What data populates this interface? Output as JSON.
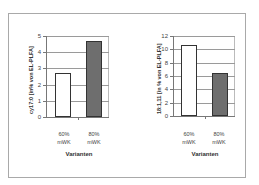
{
  "chart_data": [
    {
      "type": "bar",
      "title": "",
      "xlabel": "Varianten",
      "ylabel": "cy17:0 [in% von EL-PLFA]",
      "categories": [
        "60% mWK",
        "80% mWK"
      ],
      "category_lines": [
        [
          "60%",
          "mWK"
        ],
        [
          "80%",
          "mWK"
        ]
      ],
      "values": [
        2.7,
        4.7
      ],
      "bar_colors": [
        "#ffffff",
        "#6e6e6e"
      ],
      "ylim": [
        0,
        5
      ],
      "yticks": [
        "0",
        "1",
        "2",
        "3",
        "4",
        "5"
      ],
      "grid": true,
      "legend": null
    },
    {
      "type": "bar",
      "title": "",
      "xlabel": "Varianten",
      "ylabel": "18:1,11 [in % von EL-PLFA]",
      "categories": [
        "60% mWK",
        "80% mWK"
      ],
      "category_lines": [
        [
          "60%",
          "mWK"
        ],
        [
          "80%",
          "mWK"
        ]
      ],
      "values": [
        10.6,
        6.4
      ],
      "bar_colors": [
        "#ffffff",
        "#6e6e6e"
      ],
      "ylim": [
        0,
        12
      ],
      "yticks": [
        "0",
        "2",
        "4",
        "6",
        "8",
        "10",
        "12"
      ],
      "grid": true,
      "legend": null
    }
  ]
}
